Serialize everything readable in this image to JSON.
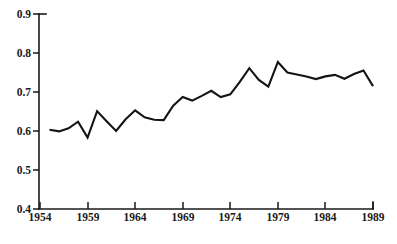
{
  "chart_data": {
    "type": "line",
    "title": "",
    "subtitle": "",
    "xlabel": "",
    "ylabel": "",
    "xlim": [
      1954,
      1989
    ],
    "ylim": [
      0.4,
      0.9
    ],
    "grid": false,
    "legend": null,
    "x_tick_labels": [
      "1954",
      "1959",
      "1964",
      "1969",
      "1974",
      "1979",
      "1984",
      "1989"
    ],
    "x_ticks": [
      1954,
      1959,
      1964,
      1969,
      1974,
      1979,
      1984,
      1989
    ],
    "y_tick_labels": [
      "0.9",
      "0.8",
      "0.7",
      "0.6",
      "0.5",
      "0.4"
    ],
    "y_ticks": [
      0.9,
      0.8,
      0.7,
      0.6,
      0.5,
      0.4
    ],
    "line_color": "#141414",
    "axis_color": "#1a1a1a",
    "background": "#ffffff",
    "x": [
      1955,
      1956,
      1957,
      1958,
      1959,
      1960,
      1961,
      1962,
      1963,
      1964,
      1965,
      1966,
      1967,
      1968,
      1969,
      1970,
      1971,
      1972,
      1973,
      1974,
      1975,
      1976,
      1977,
      1978,
      1979,
      1980,
      1981,
      1982,
      1983,
      1984,
      1985,
      1986,
      1987,
      1988,
      1989
    ],
    "values": [
      0.603,
      0.599,
      0.607,
      0.624,
      0.583,
      0.651,
      0.625,
      0.6,
      0.63,
      0.653,
      0.635,
      0.629,
      0.628,
      0.665,
      0.687,
      0.678,
      0.69,
      0.703,
      0.687,
      0.694,
      0.726,
      0.761,
      0.731,
      0.714,
      0.777,
      0.75,
      0.745,
      0.74,
      0.733,
      0.74,
      0.744,
      0.734,
      0.746,
      0.755,
      0.715
    ],
    "series": [
      {
        "name": "series-1",
        "values": [
          0.603,
          0.599,
          0.607,
          0.624,
          0.583,
          0.651,
          0.625,
          0.6,
          0.63,
          0.653,
          0.635,
          0.629,
          0.628,
          0.665,
          0.687,
          0.678,
          0.69,
          0.703,
          0.687,
          0.694,
          0.726,
          0.761,
          0.731,
          0.714,
          0.777,
          0.75,
          0.745,
          0.74,
          0.733,
          0.74,
          0.744,
          0.734,
          0.746,
          0.755,
          0.715
        ]
      }
    ]
  },
  "axis": {
    "y_labels": [
      "0.9",
      "0.8",
      "0.7",
      "0.6",
      "0.5",
      "0.4"
    ],
    "x_labels": [
      "1954",
      "1959",
      "1964",
      "1969",
      "1974",
      "1979",
      "1984",
      "1989"
    ]
  }
}
